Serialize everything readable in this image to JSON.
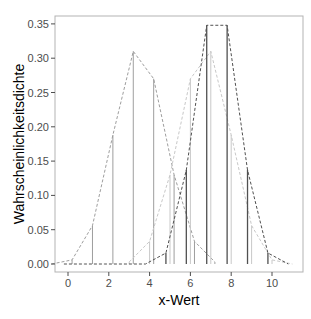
{
  "chart_data": {
    "type": "bar",
    "title": "",
    "xlabel": "x-Wert",
    "ylabel": "Wahrscheinlichkeitsdichte",
    "xlim": [
      -0.3,
      11.2
    ],
    "ylim": [
      -0.012,
      0.362
    ],
    "x_ticks": [
      0,
      2,
      4,
      6,
      8,
      10
    ],
    "x_tick_labels": [
      "0",
      "2",
      "4",
      "6",
      "8",
      "10"
    ],
    "y_ticks": [
      0.0,
      0.05,
      0.1,
      0.15,
      0.2,
      0.25,
      0.3,
      0.35
    ],
    "y_tick_labels": [
      "0.00",
      "0.05",
      "0.10",
      "0.15",
      "0.20",
      "0.25",
      "0.30",
      "0.35"
    ],
    "grid": false,
    "legend": null,
    "series": [
      {
        "name": "Verteilung A",
        "color": "#9e9e9e",
        "line_style": "dashed",
        "x": [
          -0.8,
          0.2,
          1.2,
          2.2,
          3.2,
          4.2,
          5.2,
          6.2,
          7.2
        ],
        "values": [
          0.0,
          0.006,
          0.056,
          0.188,
          0.31,
          0.27,
          0.13,
          0.033,
          0.003
        ]
      },
      {
        "name": "Verteilung B",
        "color": "#c8c8c8",
        "line_style": "dashed",
        "x": [
          3,
          4,
          5,
          6,
          7,
          8,
          9,
          10,
          11
        ],
        "values": [
          0.003,
          0.033,
          0.13,
          0.27,
          0.31,
          0.188,
          0.056,
          0.006,
          0.0
        ]
      },
      {
        "name": "Verteilung C",
        "color": "#505050",
        "line_style": "dashed",
        "x": [
          -0.2,
          0.8,
          1.8,
          2.8,
          3.8,
          4.8,
          5.8,
          6.8,
          7.8,
          8.8,
          9.8,
          10.8
        ],
        "values": [
          0.0,
          0.0,
          0.0,
          0.0,
          0.0,
          0.016,
          0.137,
          0.348,
          0.348,
          0.137,
          0.016,
          0.0
        ]
      }
    ]
  }
}
